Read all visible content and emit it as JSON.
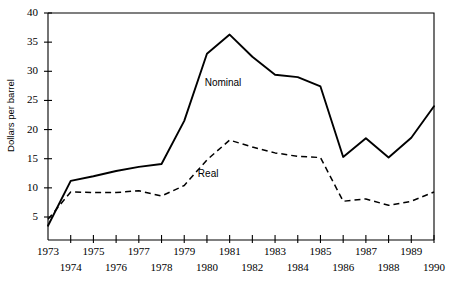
{
  "chart_data": {
    "type": "line",
    "title": "",
    "xlabel": "",
    "ylabel": "Dollars per barrel",
    "xlim": [
      1973,
      1990
    ],
    "ylim": [
      0,
      40
    ],
    "ytick_values": [
      5,
      10,
      15,
      20,
      25,
      30,
      35,
      40
    ],
    "ytick_labels": [
      "5",
      "10",
      "15",
      "20",
      "25",
      "30",
      "35",
      "40"
    ],
    "x": [
      1973,
      1974,
      1975,
      1976,
      1977,
      1978,
      1979,
      1980,
      1981,
      1982,
      1983,
      1984,
      1985,
      1986,
      1987,
      1988,
      1989,
      1990
    ],
    "xtick_labels": [
      "1973",
      "1974",
      "1975",
      "1976",
      "1977",
      "1978",
      "1979",
      "1980",
      "1981",
      "1982",
      "1983",
      "1984",
      "1985",
      "1986",
      "1987",
      "1988",
      "1989",
      "1990"
    ],
    "xtick_labels_upper": [
      "1973",
      "1975",
      "1977",
      "1979",
      "1981",
      "1983",
      "1985",
      "1987",
      "1989"
    ],
    "xtick_labels_lower": [
      "1974",
      "1976",
      "1978",
      "1980",
      "1982",
      "1984",
      "1986",
      "1988",
      "1990"
    ],
    "grid": false,
    "legend_position": "inline-annotation",
    "series": [
      {
        "name": "Nominal",
        "style": "solid",
        "color": "#000000",
        "values": [
          3.5,
          11.2,
          12.0,
          12.9,
          13.6,
          14.1,
          21.5,
          33.0,
          36.3,
          32.5,
          29.4,
          29.0,
          27.4,
          15.3,
          18.5,
          15.2,
          18.6,
          24.0
        ]
      },
      {
        "name": "Real",
        "style": "dashed",
        "color": "#000000",
        "values": [
          4.6,
          9.3,
          9.2,
          9.2,
          9.5,
          8.6,
          10.4,
          14.8,
          18.2,
          17.0,
          16.0,
          15.4,
          15.2,
          7.7,
          8.1,
          7.0,
          7.7,
          9.3
        ]
      }
    ],
    "annotations": [
      {
        "text": "Nominal",
        "x": 1979.9,
        "y": 28.0
      },
      {
        "text": "Real",
        "x": 1979.6,
        "y": 12.4
      }
    ]
  },
  "axis": {
    "y_axis_title": "Dollars per barrel"
  }
}
